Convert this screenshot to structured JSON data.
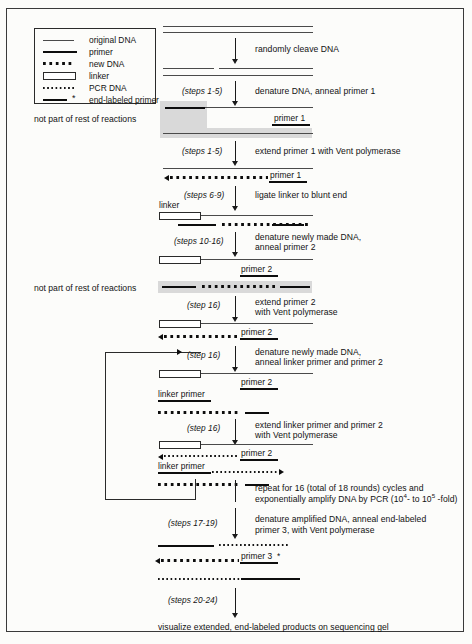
{
  "legend": {
    "title": "legend",
    "items": [
      {
        "symbol": "thin-line",
        "label": "original DNA"
      },
      {
        "symbol": "thick-line",
        "label": "primer"
      },
      {
        "symbol": "large-dots",
        "label": "new DNA"
      },
      {
        "symbol": "hollow-rectangle",
        "label": "linker"
      },
      {
        "symbol": "small-dots",
        "label": "PCR DNA"
      },
      {
        "symbol": "thick-line-asterisk",
        "label": "end-labeled primer"
      }
    ]
  },
  "notes": {
    "not_part_1": "not part of rest of reactions",
    "not_part_2": "not part of rest of reactions"
  },
  "steps": {
    "s1": {
      "step": "",
      "text": "randomly cleave DNA"
    },
    "s2": {
      "step": "(steps 1-5)",
      "text": "denature DNA, anneal primer 1"
    },
    "s3": {
      "step": "(steps 1-5)",
      "text": "extend primer 1 with Vent polymerase"
    },
    "s4": {
      "step": "(steps 6-9)",
      "text": "ligate linker to blunt end"
    },
    "s5": {
      "step": "(steps 10-16)",
      "line1": "denature newly made DNA,",
      "line2": "anneal primer 2"
    },
    "s6": {
      "step": "(step 16)",
      "line1": "extend primer 2",
      "line2": "with Vent polymerase"
    },
    "s7": {
      "step": "(step 16)",
      "line1": "denature newly made DNA,",
      "line2": "anneal linker primer and primer 2"
    },
    "s8": {
      "step": "(step 16)",
      "line1": "extend linker primer and primer 2",
      "line2": "with Vent polymerase"
    },
    "s9": {
      "step": "",
      "line1": "repeat for 16 (total of 18 rounds) cycles and",
      "line2_a": "exponentially amplify DNA by PCR (10",
      "line2_sup1": "4",
      "line2_b": "- to 10",
      "line2_sup2": "5",
      "line2_c": " -fold)"
    },
    "s10": {
      "step": "(steps 17-19)",
      "line1": "denature amplified DNA, anneal end-labeled",
      "line2": "primer 3, with Vent polymerase"
    },
    "s11": {
      "step": "(steps 20-24)",
      "text": "visualize extended, end-labeled products on sequencing gel"
    }
  },
  "labels": {
    "primer1_a": "primer 1",
    "primer1_b": "primer 1",
    "linker": "linker",
    "primer2_a": "primer 2",
    "primer2_b": "primer 2",
    "primer2_c": "primer 2",
    "primer2_d": "primer 2",
    "linker_primer_a": "linker primer",
    "linker_primer_b": "linker primer",
    "primer3": "primer 3",
    "primer3_star": "*"
  },
  "colors": {
    "ink": "#0d0d0d",
    "thin_strand": "#4a4a4a",
    "shade": "#d9d9d9",
    "border": "#3a3a3a",
    "paper": "#fcfcfa"
  }
}
